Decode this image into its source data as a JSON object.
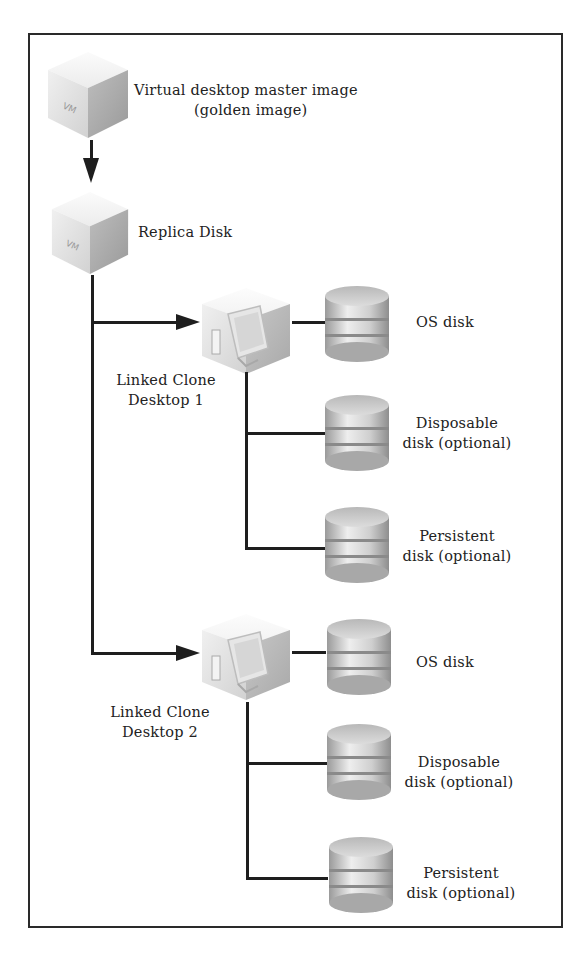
{
  "diagram": {
    "title": "",
    "master": {
      "icon": "vm-cube-icon",
      "icon_text": "VM",
      "label_line1": "Virtual desktop master image",
      "label_line2": "(golden image)"
    },
    "replica": {
      "icon": "vm-cube-icon",
      "icon_text": "VM",
      "label": "Replica Disk"
    },
    "clones": [
      {
        "label_line1": "Linked Clone",
        "label_line2": "Desktop 1",
        "icon": "desktop-cube-icon",
        "disks": [
          {
            "icon": "disk-icon",
            "label_line1": "OS disk",
            "label_line2": ""
          },
          {
            "icon": "disk-icon",
            "label_line1": "Disposable",
            "label_line2": "disk (optional)"
          },
          {
            "icon": "disk-icon",
            "label_line1": "Persistent",
            "label_line2": "disk (optional)"
          }
        ]
      },
      {
        "label_line1": "Linked Clone",
        "label_line2": "Desktop 2",
        "icon": "desktop-cube-icon",
        "disks": [
          {
            "icon": "disk-icon",
            "label_line1": "OS disk",
            "label_line2": ""
          },
          {
            "icon": "disk-icon",
            "label_line1": "Disposable",
            "label_line2": "disk (optional)"
          },
          {
            "icon": "disk-icon",
            "label_line1": "Persistent",
            "label_line2": "disk (optional)"
          }
        ]
      }
    ],
    "colors": {
      "line": "#1e1e1e",
      "border": "#2a2a2a",
      "text": "#222222"
    }
  }
}
